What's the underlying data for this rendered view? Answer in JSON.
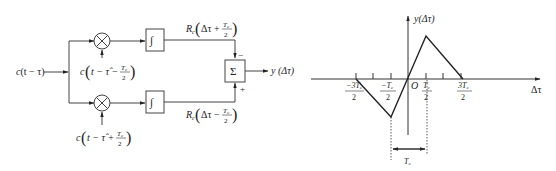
{
  "block_diagram": {
    "input_label": "c(t − τ)",
    "mixer_top_ref": "c(t − τ̂ − T_c/2)",
    "mixer_bottom_ref": "c(t − τ̂ + T_c/2)",
    "integrator_symbol": "∫",
    "top_output": "R_c(Δτ + T_c/2)",
    "bottom_output": "R_c(Δτ − T_c/2)",
    "sum_symbol": "Σ",
    "top_sign": "−",
    "bottom_sign": "+",
    "output_label": "y(Δτ)"
  },
  "graph": {
    "y_axis_label": "y(Δτ)",
    "x_axis_label": "Δτ",
    "origin_label": "O",
    "tick_labels": [
      "−3T_c/2",
      "−T_c/2",
      "T_c/2",
      "3T_c/2"
    ],
    "span_label": "T_c"
  },
  "text": {
    "in_c": "c",
    "in_rest": "(t − τ)",
    "top_ref_c": "c",
    "top_ref_rest": "t − τ̂ −",
    "bot_ref_c": "c",
    "bot_ref_rest": "t − τ̂ +",
    "Tc_num": "T",
    "Tc_sub": "c",
    "two": "2",
    "Rc_R": "R",
    "Rc_sub": "c",
    "dtau_plus": "Δτ +",
    "dtau_minus": "Δτ −",
    "minus": "−",
    "plus": "+",
    "sigma": "Σ",
    "integral": "∫",
    "y_out": "y (Δτ)",
    "g_y": "y(Δτ)",
    "g_x": "Δτ",
    "g_O": "O",
    "t_m3": "−3T",
    "t_m1": "−T",
    "t_p1": "T",
    "t_p3": "3T",
    "t_c": "c",
    "span": "T"
  }
}
